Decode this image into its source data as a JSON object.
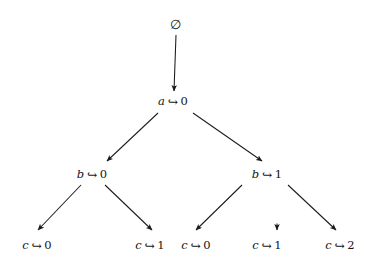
{
  "diagram": {
    "type": "tree",
    "background_color": "#ffffff",
    "text_color": "#141414",
    "edge_color": "#1a1a1a",
    "map_symbol": "↪",
    "empty_set_symbol": "∅",
    "nodes": [
      {
        "id": "root",
        "label": "∅",
        "variable": "",
        "value": "",
        "level": 0,
        "x": 176,
        "y": 25
      },
      {
        "id": "a0",
        "label": "a ↪ 0",
        "variable": "a",
        "value": "0",
        "level": 1,
        "x": 173,
        "y": 101
      },
      {
        "id": "b0",
        "label": "b ↪ 0",
        "variable": "b",
        "value": "0",
        "level": 2,
        "x": 92,
        "y": 174
      },
      {
        "id": "b1",
        "label": "b ↪ 1",
        "variable": "b",
        "value": "1",
        "level": 2,
        "x": 267,
        "y": 174
      },
      {
        "id": "c0_left",
        "label": "c ↪ 0",
        "variable": "c",
        "value": "0",
        "level": 3,
        "x": 37,
        "y": 245
      },
      {
        "id": "c1_left",
        "label": "c ↪ 1",
        "variable": "c",
        "value": "1",
        "level": 3,
        "x": 150,
        "y": 245
      },
      {
        "id": "c0_right",
        "label": "c ↪ 0",
        "variable": "c",
        "value": "0",
        "level": 3,
        "x": 196,
        "y": 245
      },
      {
        "id": "c1_right",
        "label": "c ↪ 1",
        "variable": "c",
        "value": "1",
        "level": 3,
        "x": 267,
        "y": 245
      },
      {
        "id": "c2_right",
        "label": "c ↪ 2",
        "variable": "c",
        "value": "2",
        "level": 3,
        "x": 340,
        "y": 245
      }
    ],
    "edges": [
      {
        "id": "e-root-a0",
        "from": "root",
        "to": "a0",
        "x1": 176,
        "y1": 35,
        "x2": 174,
        "y2": 91,
        "style": "vertical"
      },
      {
        "id": "e-a0-b0",
        "from": "a0",
        "to": "b0",
        "x1": 158,
        "y1": 113,
        "x2": 107,
        "y2": 161,
        "style": "diagonal-left"
      },
      {
        "id": "e-a0-b1",
        "from": "a0",
        "to": "b1",
        "x1": 193,
        "y1": 113,
        "x2": 262,
        "y2": 161,
        "style": "diagonal-right"
      },
      {
        "id": "e-b0-c0",
        "from": "b0",
        "to": "c0_left",
        "x1": 81,
        "y1": 185,
        "x2": 38,
        "y2": 230,
        "style": "diagonal-left"
      },
      {
        "id": "e-b0-c1",
        "from": "b0",
        "to": "c1_left",
        "x1": 105,
        "y1": 185,
        "x2": 152,
        "y2": 230,
        "style": "diagonal-right"
      },
      {
        "id": "e-b1-c0",
        "from": "b1",
        "to": "c0_right",
        "x1": 242,
        "y1": 185,
        "x2": 196,
        "y2": 230,
        "style": "diagonal-left"
      },
      {
        "id": "e-b1-c1",
        "from": "b1",
        "to": "c1_right",
        "x1": 277,
        "y1": 222,
        "x2": 277,
        "y2": 230,
        "style": "short-vertical-stub"
      },
      {
        "id": "e-b1-c2",
        "from": "b1",
        "to": "c2_right",
        "x1": 288,
        "y1": 185,
        "x2": 336,
        "y2": 230,
        "style": "diagonal-right"
      }
    ]
  }
}
